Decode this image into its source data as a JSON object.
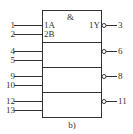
{
  "diagram": {
    "gate_symbol": "&",
    "caption": "b)",
    "sections": [
      {
        "inputs": [
          {
            "pin": "1",
            "label": "1A"
          },
          {
            "pin": "2",
            "label": "2B"
          }
        ],
        "output": {
          "pin": "3",
          "label": "1Y",
          "inverted": true
        }
      },
      {
        "inputs": [
          {
            "pin": "4"
          },
          {
            "pin": "5"
          }
        ],
        "output": {
          "pin": "6",
          "inverted": true
        }
      },
      {
        "inputs": [
          {
            "pin": "9"
          },
          {
            "pin": "10"
          }
        ],
        "output": {
          "pin": "8",
          "inverted": true
        }
      },
      {
        "inputs": [
          {
            "pin": "12"
          },
          {
            "pin": "13"
          }
        ],
        "output": {
          "pin": "11",
          "inverted": true
        }
      }
    ]
  }
}
